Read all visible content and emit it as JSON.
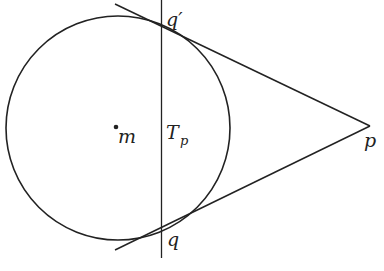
{
  "diagram": {
    "type": "geometry",
    "colors": {
      "stroke": "#222222",
      "background": "#ffffff"
    },
    "circle": {
      "center_label": "m",
      "cx": 118,
      "cy": 128,
      "r": 112
    },
    "labels": {
      "q_prime": "q′",
      "q": "q",
      "m": "m",
      "T": "T",
      "T_sub": "p",
      "p": "p"
    },
    "points": {
      "p": [
        370,
        126
      ],
      "q_prime": [
        161,
        36
      ],
      "q": [
        161,
        220
      ]
    }
  }
}
